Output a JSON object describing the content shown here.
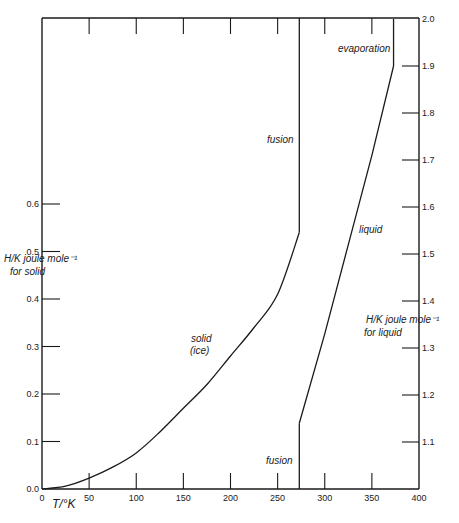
{
  "chart_data": {
    "type": "line",
    "title": "",
    "xlabel": "T/°K",
    "ylabel_left": [
      "H/K joule mole⁻¹",
      "for solid"
    ],
    "ylabel_right": [
      "H/K joule mole⁻¹",
      "for liquid"
    ],
    "xlim": [
      0,
      400
    ],
    "ylim_left": [
      0.0,
      0.7
    ],
    "ylim_right": [
      1.0,
      2.0
    ],
    "grid": false,
    "legend": "none",
    "x_ticks": [
      0,
      50,
      100,
      150,
      200,
      250,
      300,
      350,
      400
    ],
    "y_ticks_left": [
      "0.0",
      "0.1",
      "0.2",
      "0.3",
      "0.4",
      "0.5",
      "0.6"
    ],
    "y_ticks_right": [
      "1.1",
      "1.2",
      "1.3",
      "1.4",
      "1.5",
      "1.6",
      "1.7",
      "1.8",
      "1.9",
      "2.0"
    ],
    "series": [
      {
        "name": "solid (ice)",
        "axis": "left",
        "x": [
          0,
          25,
          50,
          75,
          100,
          125,
          150,
          175,
          200,
          225,
          250,
          273
        ],
        "y": [
          0.0,
          0.006,
          0.023,
          0.046,
          0.076,
          0.12,
          0.17,
          0.22,
          0.28,
          0.34,
          0.41,
          0.54
        ]
      },
      {
        "name": "fusion (solid)",
        "axis": "left",
        "x": [
          273,
          273
        ],
        "y": [
          0.54,
          1.0
        ]
      },
      {
        "name": "fusion (liquid)",
        "axis": "right",
        "x": [
          273,
          273
        ],
        "y": [
          1.0,
          1.14
        ]
      },
      {
        "name": "liquid",
        "axis": "right",
        "x": [
          273,
          300,
          325,
          350,
          373
        ],
        "y": [
          1.14,
          1.33,
          1.52,
          1.71,
          1.9
        ]
      },
      {
        "name": "evaporation",
        "axis": "right",
        "x": [
          373,
          373
        ],
        "y": [
          1.9,
          2.0
        ]
      }
    ],
    "annotations": [
      "fusion",
      "fusion",
      "evaporation",
      "liquid",
      "solid",
      "(ice)"
    ]
  },
  "labels": {
    "x_axis_title": "T/°K",
    "left_axis_title_1": "H/K joule mole⁻¹",
    "left_axis_title_2": "for solid",
    "right_axis_title_1": "H/K joule mole⁻¹",
    "right_axis_title_2": "for liquid",
    "ann_fusion_upper": "fusion",
    "ann_fusion_lower": "fusion",
    "ann_evaporation": "evaporation",
    "ann_liquid": "liquid",
    "ann_solid": "solid",
    "ann_ice": "(ice)"
  }
}
